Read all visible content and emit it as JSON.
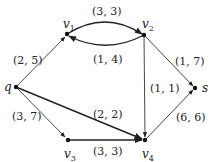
{
  "graph": {
    "nodes": [
      {
        "id": "q",
        "label": "q",
        "x": 16,
        "y": 87
      },
      {
        "id": "v1",
        "label": "v",
        "sub": "1",
        "x": 67,
        "y": 34
      },
      {
        "id": "v2",
        "label": "v",
        "sub": "2",
        "x": 144,
        "y": 35
      },
      {
        "id": "s",
        "label": "s",
        "x": 195,
        "y": 88
      },
      {
        "id": "v3",
        "label": "v",
        "sub": "3",
        "x": 68,
        "y": 140
      },
      {
        "id": "v4",
        "label": "v",
        "sub": "4",
        "x": 145,
        "y": 140
      }
    ],
    "edges": [
      {
        "from": "q",
        "to": "v1",
        "label": "(2, 5)"
      },
      {
        "from": "v1",
        "to": "v2",
        "label": "(3, 3)"
      },
      {
        "from": "v2",
        "to": "v1",
        "label": "(1, 4)"
      },
      {
        "from": "v2",
        "to": "s",
        "label": "(1, 7)"
      },
      {
        "from": "v2",
        "to": "v4",
        "label": "(1, 1)"
      },
      {
        "from": "q",
        "to": "v4",
        "label": "(2, 2)"
      },
      {
        "from": "q",
        "to": "v3",
        "label": "(3, 7)"
      },
      {
        "from": "v3",
        "to": "v4",
        "label": "(3, 3)"
      },
      {
        "from": "v4",
        "to": "s",
        "label": "(6, 6)"
      }
    ]
  },
  "labels": {
    "q": "q",
    "v": "v",
    "s": "s",
    "sub1": "1",
    "sub2": "2",
    "sub3": "3",
    "sub4": "4",
    "e_q_v1": "(2, 5)",
    "e_v1_v2": "(3, 3)",
    "e_v2_v1": "(1, 4)",
    "e_v2_s": "(1, 7)",
    "e_v2_v4": "(1, 1)",
    "e_q_v4": "(2, 2)",
    "e_q_v3": "(3, 7)",
    "e_v3_v4": "(3, 3)",
    "e_v4_s": "(6, 6)"
  }
}
